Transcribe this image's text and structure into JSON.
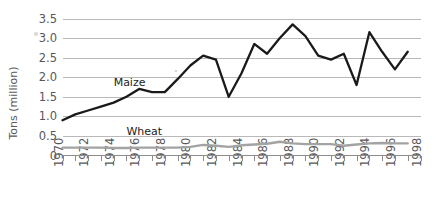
{
  "chart_data": {
    "type": "line",
    "title": "",
    "xlabel": "",
    "ylabel": "Tons (million)",
    "ylim": [
      0,
      3.5
    ],
    "xlim": [
      1970,
      1998
    ],
    "grid": true,
    "legend": "inline-labels",
    "ytick_labels": [
      "3.5",
      "3.0",
      "2.5",
      "2.0",
      "1.5",
      "1.0",
      "0.5",
      "0"
    ],
    "ytick_values": [
      3.5,
      3.0,
      2.5,
      2.0,
      1.5,
      1.0,
      0.5,
      0
    ],
    "xtick_labels": [
      "1970",
      "1972",
      "1974",
      "1976",
      "1978",
      "1980",
      "1982",
      "1984",
      "1986",
      "1988",
      "1990",
      "1992",
      "1994",
      "1996",
      "1998"
    ],
    "xtick_values": [
      1970,
      1972,
      1974,
      1976,
      1978,
      1980,
      1982,
      1984,
      1986,
      1988,
      1990,
      1992,
      1994,
      1996,
      1998
    ],
    "x": [
      1970,
      1971,
      1972,
      1973,
      1974,
      1975,
      1976,
      1977,
      1978,
      1979,
      1980,
      1981,
      1982,
      1983,
      1984,
      1985,
      1986,
      1987,
      1988,
      1989,
      1990,
      1991,
      1992,
      1993,
      1994,
      1995,
      1996,
      1997
    ],
    "series": [
      {
        "name": "Maize",
        "color": "#1a1a1a",
        "label_x": 1974,
        "label_y": 1.78,
        "values": [
          0.9,
          1.05,
          1.15,
          1.25,
          1.35,
          1.5,
          1.7,
          1.62,
          1.62,
          1.95,
          2.3,
          2.55,
          2.45,
          1.5,
          2.1,
          2.85,
          2.6,
          3.0,
          3.35,
          3.05,
          2.55,
          2.45,
          2.6,
          1.8,
          3.15,
          2.65,
          2.2,
          2.65
        ]
      },
      {
        "name": "Wheat",
        "color": "#a3a3a3",
        "label_x": 1975,
        "label_y": 0.52,
        "values": [
          0.2,
          0.2,
          0.2,
          0.2,
          0.19,
          0.19,
          0.2,
          0.2,
          0.2,
          0.2,
          0.22,
          0.27,
          0.25,
          0.22,
          0.26,
          0.28,
          0.3,
          0.35,
          0.31,
          0.29,
          0.29,
          0.29,
          0.25,
          0.28,
          0.31,
          0.32,
          0.31,
          0.31
        ]
      }
    ]
  },
  "figure": {
    "y_axis_title": "Tons (million)",
    "maize_label": "Maize",
    "wheat_label": "Wheat"
  }
}
